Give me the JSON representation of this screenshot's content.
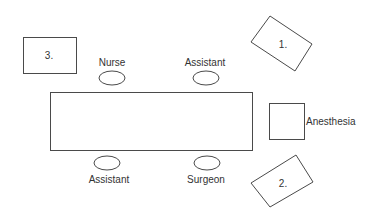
{
  "diagram": {
    "title": "",
    "table": {
      "label": ""
    },
    "positions": [
      {
        "id": "nurse",
        "label": "Nurse"
      },
      {
        "id": "assistant-top",
        "label": "Assistant"
      },
      {
        "id": "assistant-bottom",
        "label": "Assistant"
      },
      {
        "id": "surgeon",
        "label": "Surgeon"
      }
    ],
    "stations": [
      {
        "id": "box-1",
        "label": "1."
      },
      {
        "id": "box-2",
        "label": "2."
      },
      {
        "id": "box-3",
        "label": "3."
      },
      {
        "id": "anesthesia",
        "label": "Anesthesia"
      }
    ],
    "colors": {
      "stroke": "#4a4a4a",
      "text": "#333333",
      "background": "#ffffff"
    }
  }
}
